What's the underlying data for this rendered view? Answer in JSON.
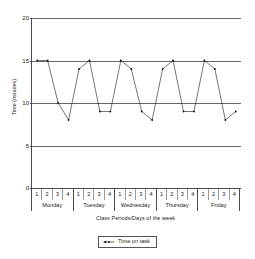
{
  "chart_data": {
    "type": "line",
    "title": "",
    "xlabel": "Class Periods/Days of the week",
    "ylabel": "Time (minutes)",
    "ylim": [
      0,
      20
    ],
    "yticks": [
      0,
      5,
      10,
      15,
      20
    ],
    "grid": true,
    "legend_position": "bottom",
    "days": [
      "Monday",
      "Tuesday",
      "Wednesday",
      "Thursday",
      "Friday"
    ],
    "periods": [
      "1",
      "2",
      "3",
      "4"
    ],
    "categories": [
      "Monday 1",
      "Monday 2",
      "Monday 3",
      "Monday 4",
      "Tuesday 1",
      "Tuesday 2",
      "Tuesday 3",
      "Tuesday 4",
      "Wednesday 1",
      "Wednesday 2",
      "Wednesday 3",
      "Wednesday 4",
      "Thursday 1",
      "Thursday 2",
      "Thursday 3",
      "Thursday 4",
      "Friday 1",
      "Friday 2",
      "Friday 3",
      "Friday 4"
    ],
    "series": [
      {
        "name": "Time on task",
        "color": "#1a1a1a",
        "values": [
          15,
          15,
          10,
          8,
          14,
          15,
          9,
          9,
          15,
          14,
          9,
          8,
          14,
          15,
          9,
          9,
          15,
          14,
          8,
          9
        ]
      }
    ]
  },
  "legend": {
    "entries": [
      {
        "label": "Time on task",
        "symbol": "line-marker-symbol"
      }
    ]
  }
}
